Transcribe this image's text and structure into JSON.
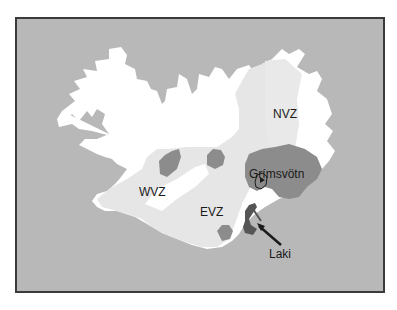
{
  "map": {
    "subject": "Iceland volcanic zones",
    "colors": {
      "ocean": "#b8b8b8",
      "land": "#ffffff",
      "volcanic_zone": "#e6e6e6",
      "glacier": "#8c8c8c",
      "laki_fissure": "#555555",
      "frame": "#3a3a3a",
      "text": "#1a1a1a"
    },
    "labels": {
      "nvz": "NVZ",
      "wvz": "WVZ",
      "evz": "EVZ",
      "grimsvotn": "Grímsvötn",
      "laki": "Laki"
    },
    "legend_items": []
  }
}
